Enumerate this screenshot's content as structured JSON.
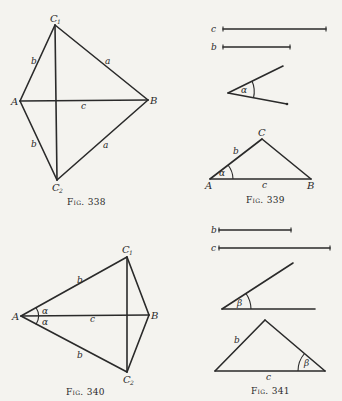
{
  "figures": {
    "fig338": {
      "caption": "Fig. 338",
      "points": {
        "A": "A",
        "B": "B",
        "C1": "C",
        "C1_sub": "1",
        "C2": "C",
        "C2_sub": "2"
      },
      "sides": {
        "AC1": "b",
        "C1B": "a",
        "AB": "c",
        "AC2": "b",
        "C2B": "a"
      }
    },
    "fig339": {
      "caption": "Fig. 339",
      "given_segments": [
        {
          "label": "c"
        },
        {
          "label": "b"
        }
      ],
      "given_angle": "α",
      "points": {
        "A": "A",
        "B": "B",
        "C": "C"
      },
      "sides": {
        "AC": "b",
        "AB": "c"
      },
      "angle_at_A": "α"
    },
    "fig340": {
      "caption": "Fig. 340",
      "points": {
        "A": "A",
        "B": "B",
        "C1": "C",
        "C1_sub": "1",
        "C2": "C",
        "C2_sub": "2"
      },
      "sides": {
        "AC1": "b",
        "AB": "c",
        "AC2": "b"
      },
      "angle_upper": "α",
      "angle_lower": "α"
    },
    "fig341": {
      "caption": "Fig. 341",
      "given_segments": [
        {
          "label": "b"
        },
        {
          "label": "c"
        }
      ],
      "given_angle": "β",
      "sides": {
        "left": "b",
        "base": "c"
      },
      "angle_at_right": "β"
    }
  }
}
